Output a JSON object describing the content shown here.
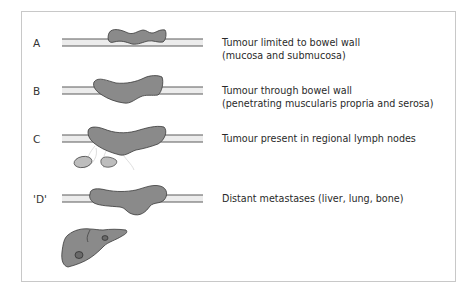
{
  "colors": {
    "tumour_fill": "#8a8a8a",
    "tumour_stroke": "#3a3a3a",
    "bowel_wall_fill": "#ececec",
    "bowel_wall_stroke": "#5a5a5a",
    "lymph_node_fill": "#bdbdbd",
    "frame_border": "#c8c8c8"
  },
  "stages": [
    {
      "label": "A",
      "line1": "Tumour limited to bowel wall",
      "line2": "(mucosa and submucosa)"
    },
    {
      "label": "B",
      "line1": "Tumour through bowel wall",
      "line2": "(penetrating muscularis propria and serosa)"
    },
    {
      "label": "C",
      "line1": "Tumour present in regional lymph nodes",
      "line2": ""
    },
    {
      "label": "'D'",
      "line1": "Distant metastases (liver, lung, bone)",
      "line2": ""
    }
  ]
}
